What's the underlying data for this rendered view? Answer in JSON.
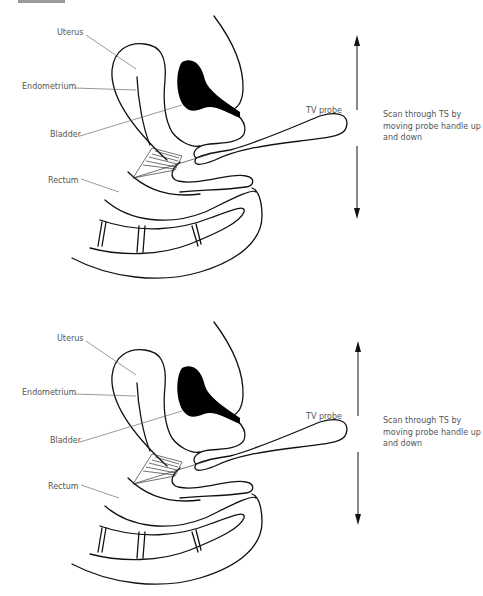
{
  "diagrams": [
    {
      "labels": {
        "uterus": "Uterus",
        "endometrium": "Endometrium",
        "bladder": "Bladder",
        "rectum": "Rectum",
        "probe": "TV probe"
      },
      "note": "Scan through TS by moving probe handle up and down"
    },
    {
      "labels": {
        "uterus": "Uterus",
        "endometrium": "Endometrium",
        "bladder": "Bladder",
        "rectum": "Rectum",
        "probe": "TV probe"
      },
      "note": "Scan through TS by moving probe handle up and down"
    }
  ],
  "colors": {
    "line": "#111111",
    "label_text": "#555555",
    "leader_line": "#555555",
    "fill": "#000000"
  }
}
